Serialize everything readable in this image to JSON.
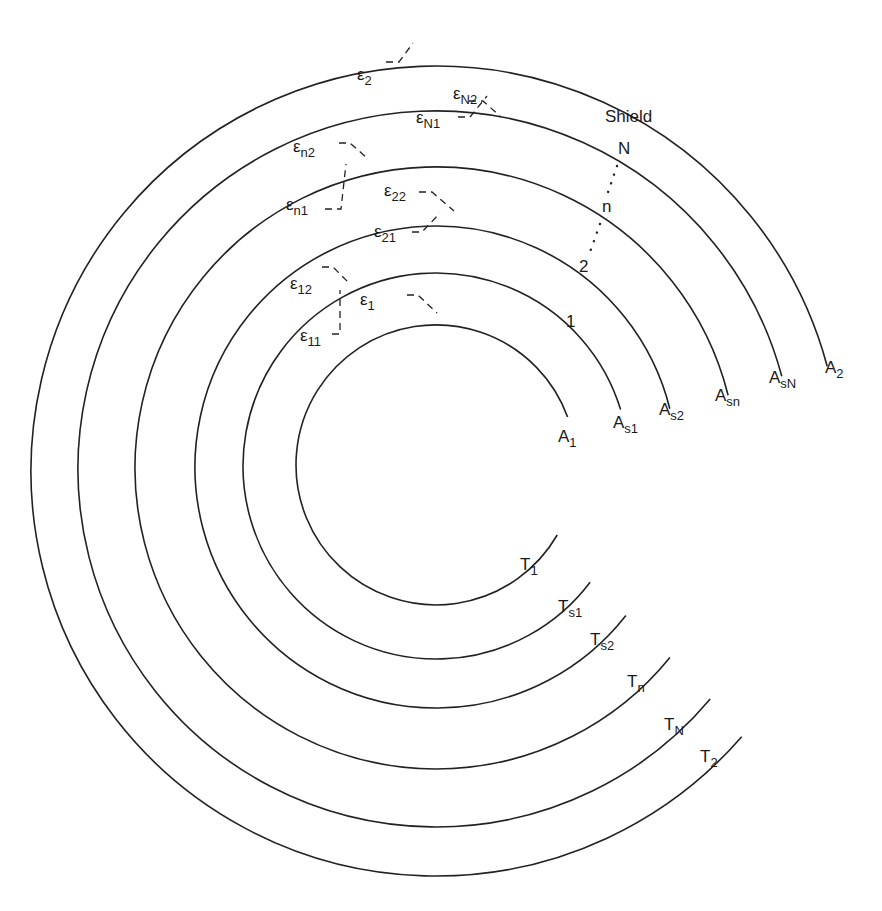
{
  "figure": {
    "colors": {
      "line": "#222222",
      "background": "#ffffff"
    }
  },
  "rings": [
    {
      "id": "surface-1",
      "r": 140,
      "cy": 465,
      "area": {
        "main": "A",
        "sub": "1"
      },
      "temp": {
        "main": "T",
        "sub": "1"
      },
      "index": "1",
      "gap_top_deg": -20,
      "gap_bot_deg": 30
    },
    {
      "id": "shield-1",
      "r": 193,
      "cy": 466,
      "area": {
        "main": "A",
        "sub": "s1"
      },
      "temp": {
        "main": "T",
        "sub": "s1"
      },
      "index": "1",
      "gap_top_deg": -17,
      "gap_bot_deg": 37
    },
    {
      "id": "shield-2",
      "r": 241,
      "cy": 467,
      "area": {
        "main": "A",
        "sub": "s2"
      },
      "temp": {
        "main": "T",
        "sub": "s2"
      },
      "index": "2",
      "gap_top_deg": -14,
      "gap_bot_deg": 38
    },
    {
      "id": "shield-n",
      "r": 301,
      "cy": 468,
      "area": {
        "main": "A",
        "sub": "sn"
      },
      "temp": {
        "main": "T",
        "sub": "n"
      },
      "index": "n",
      "gap_top_deg": -14,
      "gap_bot_deg": 39
    },
    {
      "id": "shield-N",
      "r": 358,
      "cy": 469,
      "area": {
        "main": "A",
        "sub": "sN"
      },
      "temp": {
        "main": "T",
        "sub": "N"
      },
      "index": "N",
      "gap_top_deg": -15,
      "gap_bot_deg": 40
    },
    {
      "id": "surface-2",
      "r": 405,
      "cy": 471,
      "area": {
        "main": "A",
        "sub": "2"
      },
      "temp": {
        "main": "T",
        "sub": "2"
      },
      "index": "",
      "gap_top_deg": -15,
      "gap_bot_deg": 41
    }
  ],
  "labels": {
    "shield": "Shield",
    "index_1": "1",
    "index_2": "2",
    "index_n": "n",
    "index_N": "N",
    "area": {
      "A1": {
        "main": "A",
        "sub": "1"
      },
      "As1": {
        "main": "A",
        "sub": "s1"
      },
      "As2": {
        "main": "A",
        "sub": "s2"
      },
      "Asn": {
        "main": "A",
        "sub": "sn"
      },
      "AsN": {
        "main": "A",
        "sub": "sN"
      },
      "A2": {
        "main": "A",
        "sub": "2"
      }
    },
    "temp": {
      "T1": {
        "main": "T",
        "sub": "1"
      },
      "Ts1": {
        "main": "T",
        "sub": "s1"
      },
      "Ts2": {
        "main": "T",
        "sub": "s2"
      },
      "Tn": {
        "main": "T",
        "sub": "n"
      },
      "TN": {
        "main": "T",
        "sub": "N"
      },
      "T2": {
        "main": "T",
        "sub": "2"
      }
    },
    "emissivity": {
      "e1": {
        "main": "ε",
        "sub": "1"
      },
      "e11": {
        "main": "ε",
        "sub": "11"
      },
      "e12": {
        "main": "ε",
        "sub": "12"
      },
      "e21": {
        "main": "ε",
        "sub": "21"
      },
      "e22": {
        "main": "ε",
        "sub": "22"
      },
      "en1": {
        "main": "ε",
        "sub": "n1"
      },
      "en2": {
        "main": "ε",
        "sub": "n2"
      },
      "eN1": {
        "main": "ε",
        "sub": "N1"
      },
      "eN2": {
        "main": "ε",
        "sub": "N2"
      },
      "e2": {
        "main": "ε",
        "sub": "2"
      }
    }
  }
}
